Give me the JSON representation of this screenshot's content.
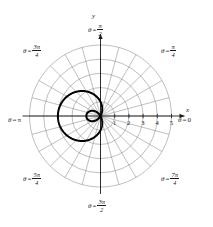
{
  "figure": {
    "kind": "polar-plot",
    "background": "#ffffff",
    "ink": "#1a1a1a",
    "grid_color": "#8a8a8a",
    "curve_color": "#000000"
  },
  "axes": {
    "x_axis_label": "x",
    "y_axis_label": "y",
    "radial_ticks": [
      "1",
      "2",
      "3",
      "4",
      "5"
    ],
    "radial_tick_values": [
      1,
      2,
      3,
      4,
      5
    ],
    "r_max": 5
  },
  "angle_labels": [
    {
      "id": "theta-0",
      "eq": "=",
      "theta": "θ",
      "value_plain": "0",
      "num": "",
      "den": "",
      "simple": "0",
      "degrees": 0
    },
    {
      "id": "theta-pi-4",
      "eq": "=",
      "theta": "θ",
      "value_plain": "π/4",
      "num": "π",
      "den": "4",
      "simple": "",
      "degrees": 45
    },
    {
      "id": "theta-pi-2",
      "eq": "=",
      "theta": "θ",
      "value_plain": "π/2",
      "num": "π",
      "den": "2",
      "simple": "",
      "degrees": 90
    },
    {
      "id": "theta-3pi-4",
      "eq": "=",
      "theta": "θ",
      "value_plain": "3π/4",
      "num": "3π",
      "den": "4",
      "simple": "",
      "degrees": 135
    },
    {
      "id": "theta-pi",
      "eq": "=",
      "theta": "θ",
      "value_plain": "π",
      "num": "",
      "den": "",
      "simple": "π",
      "degrees": 180
    },
    {
      "id": "theta-5pi-4",
      "eq": "=",
      "theta": "θ",
      "value_plain": "5π/4",
      "num": "5π",
      "den": "4",
      "simple": "",
      "degrees": 225
    },
    {
      "id": "theta-3pi-2",
      "eq": "=",
      "theta": "θ",
      "value_plain": "3π/2",
      "num": "3π",
      "den": "2",
      "simple": "",
      "degrees": 270
    },
    {
      "id": "theta-7pi-4",
      "eq": "=",
      "theta": "θ",
      "value_plain": "7π/4",
      "num": "7π",
      "den": "4",
      "simple": "",
      "degrees": 315
    }
  ],
  "chart_data": {
    "type": "line",
    "coordinate_system": "polar",
    "title": "",
    "xlabel": "x",
    "ylabel": "y",
    "rlim": [
      0,
      5
    ],
    "grid": true,
    "grid_circles": [
      1,
      2,
      3,
      4,
      5
    ],
    "grid_spokes_deg": [
      0,
      15,
      30,
      45,
      60,
      75,
      90,
      105,
      120,
      135,
      150,
      165,
      180,
      195,
      210,
      225,
      240,
      255,
      270,
      285,
      300,
      315,
      330,
      345
    ],
    "legend": "none",
    "series": [
      {
        "name": "limacon-with-inner-loop",
        "equation": "r = 1 − 2 cos θ",
        "a": 1,
        "b": 2,
        "r_max_abs": 3,
        "inner_loop": true,
        "theta_range_deg": [
          0,
          360
        ],
        "samples_deg": [
          0,
          5,
          10,
          15,
          20,
          25,
          30,
          35,
          40,
          45,
          50,
          55,
          60,
          65,
          70,
          75,
          80,
          85,
          90,
          95,
          100,
          105,
          110,
          115,
          120,
          125,
          130,
          135,
          140,
          145,
          150,
          155,
          160,
          165,
          170,
          175,
          180,
          185,
          190,
          195,
          200,
          205,
          210,
          215,
          220,
          225,
          230,
          235,
          240,
          245,
          250,
          255,
          260,
          265,
          270,
          275,
          280,
          285,
          290,
          295,
          300,
          305,
          310,
          315,
          320,
          325,
          330,
          335,
          340,
          345,
          350,
          355,
          360
        ],
        "r_values": [
          -1.0,
          -0.993,
          -0.97,
          -0.932,
          -0.879,
          -0.813,
          -0.732,
          -0.638,
          -0.532,
          -0.414,
          -0.286,
          -0.147,
          0.0,
          0.155,
          0.316,
          0.482,
          0.653,
          0.826,
          1.0,
          1.174,
          1.347,
          1.518,
          1.684,
          1.845,
          2.0,
          2.147,
          2.286,
          2.414,
          2.532,
          2.638,
          2.732,
          2.813,
          2.879,
          2.932,
          2.97,
          2.993,
          3.0,
          2.993,
          2.97,
          2.932,
          2.879,
          2.813,
          2.732,
          2.638,
          2.532,
          2.414,
          2.286,
          2.147,
          2.0,
          1.845,
          1.684,
          1.518,
          1.347,
          1.174,
          1.0,
          0.826,
          0.653,
          0.482,
          0.316,
          0.155,
          0.0,
          -0.147,
          -0.286,
          -0.414,
          -0.532,
          -0.638,
          -0.732,
          -0.813,
          -0.879,
          -0.932,
          -0.97,
          -0.993,
          -1.0
        ]
      }
    ]
  }
}
